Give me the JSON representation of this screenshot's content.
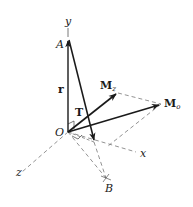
{
  "diagram": {
    "type": "3d-vector-moment-diagram",
    "axes": [
      {
        "name": "y",
        "label": "y"
      },
      {
        "name": "x",
        "label": "x"
      },
      {
        "name": "z",
        "label": "z"
      }
    ],
    "points": [
      {
        "id": "O",
        "label": "O"
      },
      {
        "id": "A",
        "label": "A"
      },
      {
        "id": "B",
        "label": "B"
      }
    ],
    "vectors": [
      {
        "id": "r",
        "label": "r",
        "from": "O",
        "to": "A"
      },
      {
        "id": "T",
        "label": "T",
        "from": "A",
        "to": "B"
      },
      {
        "id": "Mz",
        "label": "M",
        "subscript": "z",
        "from": "O"
      },
      {
        "id": "Mo",
        "label": "M",
        "subscript": "o",
        "from": "O"
      }
    ],
    "colors": {
      "ink": "#1a1a1a",
      "dashed": "#777777",
      "background": "#ffffff"
    }
  },
  "labels": {
    "y": "y",
    "x": "x",
    "z": "z",
    "A": "A",
    "B": "B",
    "O": "O",
    "r": "r",
    "T": "T",
    "Mz_main": "M",
    "Mz_sub": "z",
    "Mo_main": "M",
    "Mo_sub": "o"
  }
}
